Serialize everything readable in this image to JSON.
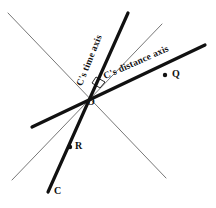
{
  "figure": {
    "type": "spacetime-diagram",
    "background_color": "#ffffff",
    "line_color_bold": "#111111",
    "line_color_thin": "#777777"
  },
  "axes": {
    "time_axis_label": "C's time axis",
    "distance_axis_label": "C's distance axis"
  },
  "points": {
    "origin_label": "O",
    "q_label": "Q",
    "r_label": "R",
    "c_label": "C"
  },
  "geometry": {
    "origin": {
      "x": 86,
      "y": 93
    },
    "bold_time_axis": {
      "x1": 128,
      "y1": 13,
      "x2": 48,
      "y2": 192
    },
    "bold_distance_axis": {
      "x1": 205,
      "y1": 45,
      "x2": 32,
      "y2": 127
    },
    "thin_line_a": {
      "x1": 8,
      "y1": 13,
      "x2": 166,
      "y2": 178
    },
    "thin_line_b": {
      "x1": 162,
      "y1": 24,
      "x2": 12,
      "y2": 180
    },
    "q_dot": {
      "x": 165,
      "y": 75,
      "r": 2.2
    },
    "r_dot": {
      "x": 70,
      "y": 147,
      "r": 2.2
    },
    "angle_marker": [
      {
        "x": 96,
        "y": 77
      },
      {
        "x": 105,
        "y": 82
      },
      {
        "x": 100,
        "y": 88
      },
      {
        "x": 92,
        "y": 83
      }
    ]
  }
}
